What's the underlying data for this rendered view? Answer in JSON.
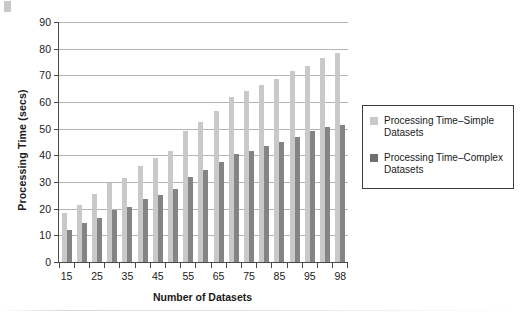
{
  "chart_data": {
    "type": "bar",
    "title": "",
    "xlabel": "Number of Datasets",
    "ylabel": "Processing Time (secs)",
    "ylim": [
      0,
      90
    ],
    "ytick_values": [
      0,
      10,
      20,
      30,
      40,
      50,
      60,
      70,
      80,
      90
    ],
    "ytick_labels": [
      "0",
      "10",
      "20",
      "30",
      "40",
      "50",
      "60",
      "70",
      "80",
      "90"
    ],
    "grid": "horizontal",
    "legend_position": "right",
    "categories": [
      "15",
      "20",
      "25",
      "30",
      "35",
      "40",
      "45",
      "50",
      "55",
      "60",
      "65",
      "70",
      "75",
      "80",
      "85",
      "90",
      "95",
      "97",
      "98"
    ],
    "xtick_labels": [
      "15",
      "",
      "25",
      "",
      "35",
      "",
      "45",
      "",
      "55",
      "",
      "65",
      "",
      "75",
      "",
      "85",
      "",
      "95",
      "",
      "98"
    ],
    "series": [
      {
        "name": "Processing Time–Simple Datasets",
        "color": "#c9c9c9",
        "values": [
          18.5,
          21.5,
          25.5,
          29.5,
          31.5,
          36.0,
          39.0,
          41.5,
          49.0,
          52.5,
          56.5,
          62.0,
          64.0,
          66.5,
          68.5,
          71.5,
          73.5,
          76.5,
          78.5
        ]
      },
      {
        "name": "Processing Time–Complex Datasets",
        "color": "#848484",
        "values": [
          12.0,
          14.5,
          16.5,
          19.5,
          20.5,
          23.5,
          25.0,
          27.5,
          32.0,
          34.5,
          37.5,
          40.5,
          41.5,
          43.5,
          45.0,
          47.0,
          49.0,
          50.5,
          51.5
        ]
      }
    ]
  },
  "legend": {
    "items": [
      {
        "label_line1": "Processing Time–Simple",
        "label_line2": "Datasets",
        "swatch": "light-gray-swatch"
      },
      {
        "label_line1": "Processing Time–Complex",
        "label_line2": "Datasets",
        "swatch": "dark-gray-swatch"
      }
    ]
  }
}
